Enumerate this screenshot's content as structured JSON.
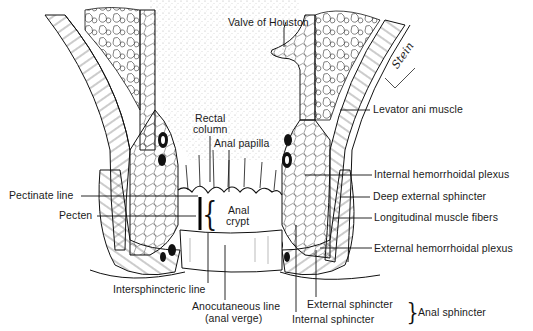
{
  "figure": {
    "signature": "Stein",
    "labels": {
      "valve_of_houston": "Valve of Houston",
      "levator_ani": "Levator ani muscle",
      "rectal_column_1": "Rectal",
      "rectal_column_2": "column",
      "anal_papilla": "Anal papilla",
      "internal_hemorrhoidal_plexus": "Internal hemorrhoidal plexus",
      "deep_external_sphincter": "Deep external sphincter",
      "longitudinal_muscle_fibers": "Longitudinal muscle fibers",
      "external_hemorrhoidal_plexus": "External hemorrhoidal plexus",
      "pectinate_line": "Pectinate line",
      "pecten": "Pecten",
      "anal_crypt_1": "Anal",
      "anal_crypt_2": "crypt",
      "intersphincteric_line": "Intersphincteric line",
      "anocutaneous_line_1": "Anocutaneous line",
      "anocutaneous_line_2": "(anal verge)",
      "external_sphincter": "External sphincter",
      "internal_sphincter": "Internal sphincter",
      "anal_sphincter": "Anal sphincter"
    },
    "colors": {
      "ink": "#111111",
      "stipple": "#9a9a9a",
      "background": "#ffffff"
    }
  }
}
